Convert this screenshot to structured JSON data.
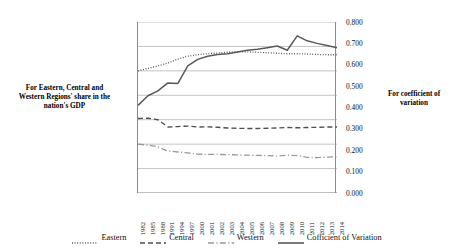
{
  "chart_data": {
    "type": "line",
    "title": "",
    "xlabel": "",
    "ylabel": "For Eastern, Central and Western Regions' share in the nation's GDP",
    "y2label": "For coefficient of variation",
    "grid": true,
    "legend_position": "bottom",
    "categories": [
      "1982",
      "1985",
      "1988",
      "1991",
      "1994",
      "1997",
      "2000",
      "2001",
      "2002",
      "2003",
      "2004",
      "2005",
      "2006",
      "2007",
      "2008",
      "2009",
      "2010",
      "2011",
      "2012",
      "2013",
      "2014"
    ],
    "ylim": [
      0,
      70
    ],
    "yticks": [
      "0.0%",
      "10.0%",
      "20.0%",
      "30.0%",
      "40.0%",
      "50.0%",
      "60.0%",
      "70.0%"
    ],
    "ytick_values": [
      0,
      10,
      20,
      30,
      40,
      50,
      60,
      70
    ],
    "y2lim": [
      0,
      0.8
    ],
    "y2ticks": [
      "0.000",
      "0.100",
      "0.200",
      "0.300",
      "0.400",
      "0.500",
      "0.600",
      "0.700",
      "0.800"
    ],
    "y2tick_values": [
      0,
      0.1,
      0.2,
      0.3,
      0.4,
      0.5,
      0.6,
      0.7,
      0.8
    ],
    "series": [
      {
        "name": "Eastern",
        "axis": "left",
        "style": "dotted",
        "color": "#4d4d4d",
        "values": [
          50.0,
          51.0,
          52.0,
          53.2,
          54.8,
          56.0,
          56.6,
          57.0,
          57.3,
          57.6,
          57.8,
          57.8,
          57.6,
          57.4,
          57.2,
          57.0,
          57.0,
          56.9,
          56.7,
          56.6,
          56.6
        ]
      },
      {
        "name": "Central",
        "axis": "left",
        "style": "dashed",
        "color": "#4d4d4d",
        "values": [
          30.5,
          30.6,
          30.0,
          27.0,
          27.2,
          27.4,
          27.0,
          27.1,
          26.9,
          26.6,
          26.5,
          26.4,
          26.4,
          26.5,
          26.6,
          26.8,
          26.7,
          26.8,
          26.9,
          27.0,
          27.0
        ]
      },
      {
        "name": "Western",
        "axis": "left",
        "style": "dashdot",
        "color": "#999999",
        "values": [
          20.0,
          19.6,
          18.9,
          17.2,
          16.8,
          16.4,
          15.9,
          15.8,
          15.8,
          15.7,
          15.6,
          15.5,
          15.4,
          15.3,
          15.1,
          15.5,
          15.3,
          14.6,
          14.5,
          14.7,
          14.9
        ]
      },
      {
        "name": "Cofficient of Variation",
        "axis": "right",
        "style": "solid",
        "color": "#595959",
        "values": [
          0.41,
          0.455,
          0.478,
          0.515,
          0.512,
          0.595,
          0.625,
          0.64,
          0.648,
          0.652,
          0.66,
          0.668,
          0.672,
          0.68,
          0.688,
          0.668,
          0.735,
          0.712,
          0.7,
          0.69,
          0.68
        ]
      }
    ]
  },
  "axes": {
    "left_title": "For Eastern, Central and Western Regions' share in the nation's GDP",
    "right_title": "For coefficient of variation"
  },
  "legend": {
    "items": [
      {
        "label": "Eastern"
      },
      {
        "label": "Central"
      },
      {
        "label": "Western"
      },
      {
        "label": "Cofficient of Variation"
      }
    ]
  }
}
